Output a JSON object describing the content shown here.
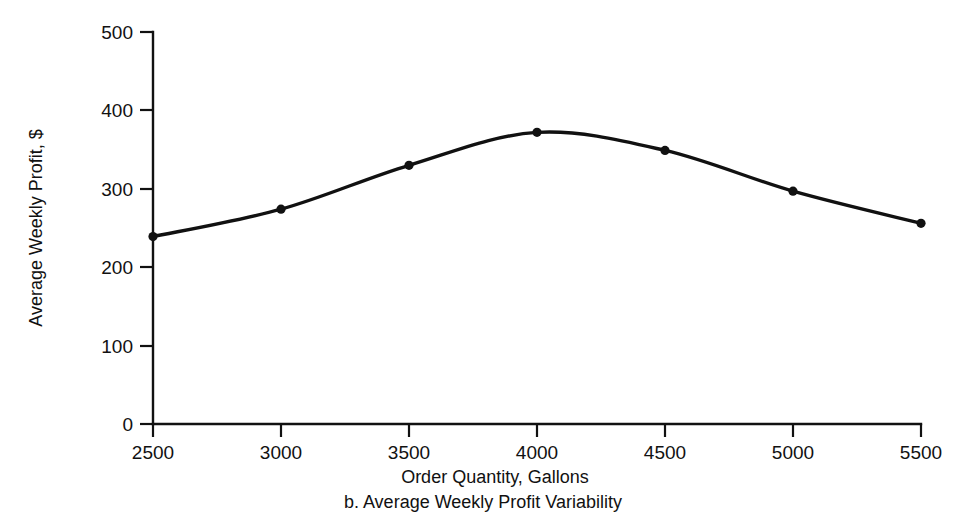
{
  "chart_data": {
    "type": "line",
    "title": "",
    "caption": "b. Average Weekly Profit Variability",
    "xlabel": "Order Quantity, Gallons",
    "ylabel": "Average Weekly Profit, $",
    "x": [
      2500,
      3000,
      3500,
      4000,
      4500,
      5000,
      5500
    ],
    "values": [
      239,
      274,
      330,
      372,
      349,
      297,
      256
    ],
    "series": [
      {
        "name": "Average Weekly Profit",
        "values": [
          239,
          274,
          330,
          372,
          349,
          297,
          256
        ]
      }
    ],
    "xlim": [
      2500,
      5500
    ],
    "ylim": [
      0,
      500
    ],
    "xticks": [
      2500,
      3000,
      3500,
      4000,
      4500,
      5000,
      5500
    ],
    "yticks": [
      0,
      100,
      200,
      300,
      400,
      500
    ],
    "xtick_labels": [
      "2500",
      "3000",
      "3500",
      "4000",
      "4500",
      "5000",
      "5500"
    ],
    "ytick_labels": [
      "0",
      "100",
      "200",
      "300",
      "400",
      "500"
    ],
    "grid": false,
    "legend": false,
    "markers": "filled-circle",
    "line_color": "#111111",
    "marker_color": "#111111",
    "background_color": "#ffffff",
    "smoothing": "spline"
  }
}
